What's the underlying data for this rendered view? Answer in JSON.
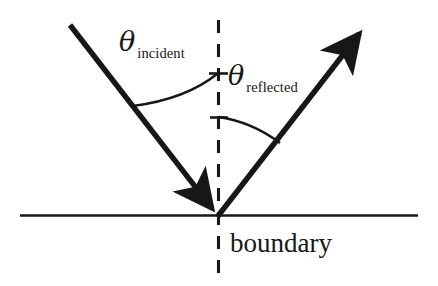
{
  "diagram": {
    "background_color": "#ffffff",
    "ink_color": "#171717",
    "labels": {
      "theta_symbol": "θ",
      "incident_subscript": "incident",
      "reflected_subscript": "reflected",
      "boundary": "boundary"
    },
    "geometry": {
      "vertex": {
        "x": 218,
        "y": 216
      },
      "boundary_line": {
        "x1": 20,
        "y1": 215,
        "x2": 418,
        "y2": 215
      },
      "normal_dashed_line": {
        "x": 218,
        "y_top": 20,
        "y_bottom": 276
      },
      "incident_ray": {
        "x1": 70,
        "y1": 25,
        "x2": 218,
        "y2": 216,
        "arrow_at": "vertex"
      },
      "reflected_ray": {
        "x1": 218,
        "y1": 216,
        "x2": 366,
        "y2": 25,
        "arrow_at": "tip"
      },
      "incident_arc": {
        "start_x": 133,
        "start_y": 106,
        "end_x": 218,
        "end_y": 74
      },
      "reflected_arc": {
        "start_x": 218,
        "start_y": 117,
        "end_x": 280,
        "end_y": 143
      },
      "incident_angle_deg": 38,
      "reflected_angle_deg": 38
    }
  }
}
